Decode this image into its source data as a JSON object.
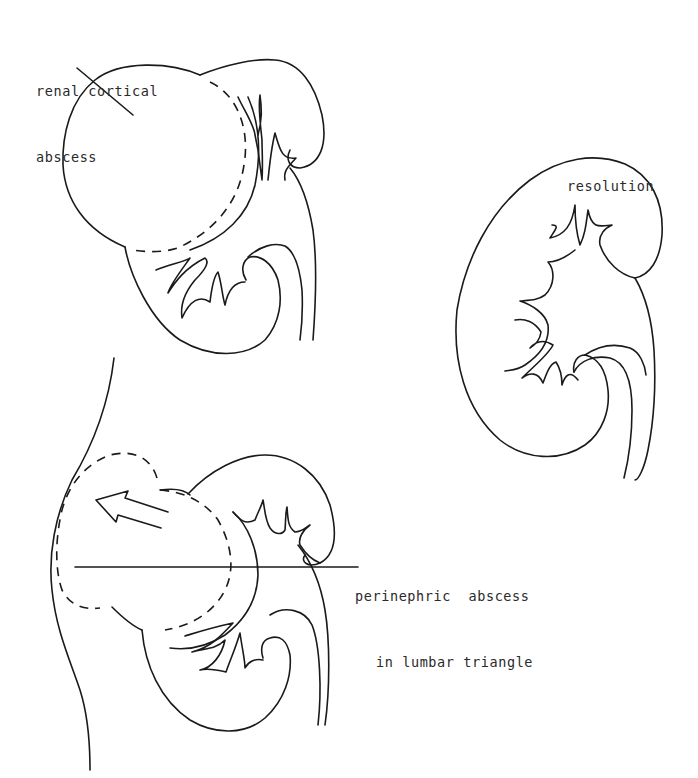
{
  "figure": {
    "panels": [
      {
        "id": "renal-cortical-abscess",
        "label_lines": [
          "renal cortical",
          "abscess"
        ]
      },
      {
        "id": "resolution",
        "label_lines": [
          "resolution"
        ]
      },
      {
        "id": "perinephric-abscess",
        "label_lines": [
          "perinephric  abscess",
          "in lumbar triangle"
        ]
      }
    ],
    "colors": {
      "line": "#1a1a1a",
      "text": "#2a2a2a",
      "background": "#ffffff"
    }
  }
}
